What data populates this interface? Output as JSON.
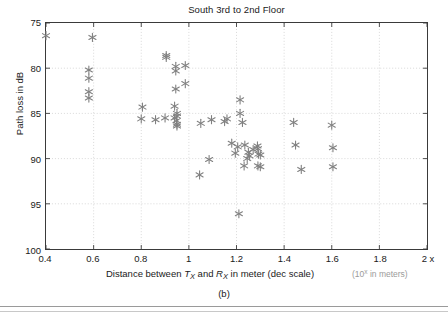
{
  "figure": {
    "panel_caption": "(b)"
  },
  "chart_data": {
    "type": "scatter",
    "title": "South 3rd to 2nd Floor",
    "xlabel": "Distance between TX and RX in meter (dec scale)",
    "xlabel_parts": {
      "a": "Distance between ",
      "t": "T",
      "tsub": "X",
      "b": " and ",
      "r": "R",
      "rsub": "X",
      "c": " in meter (dec scale)"
    },
    "xlabel_note_parts": {
      "a": "(10",
      "sup": "x",
      "b": " in meters)"
    },
    "ylabel": "Path loss in dB",
    "xlim": [
      0.4,
      2.0
    ],
    "ylim": [
      75,
      100
    ],
    "y_inverted": true,
    "grid": true,
    "legend": null,
    "marker": "asterisk-6",
    "marker_color": "#808080",
    "xticks": [
      0.4,
      0.6,
      0.8,
      1.0,
      1.2,
      1.4,
      1.6,
      1.8,
      2.0
    ],
    "xtick_labels": [
      "0.4",
      "0.6",
      "0.8",
      "1",
      "1.2",
      "1.4",
      "1.6",
      "1.8",
      "2 x"
    ],
    "yticks": [
      75,
      80,
      85,
      90,
      95,
      100
    ],
    "ytick_labels": [
      "75",
      "80",
      "85",
      "90",
      "95",
      "100"
    ],
    "points": [
      [
        0.4,
        76.4
      ],
      [
        0.595,
        76.6
      ],
      [
        0.58,
        80.2
      ],
      [
        0.58,
        81.1
      ],
      [
        0.58,
        82.6
      ],
      [
        0.58,
        83.3
      ],
      [
        0.805,
        84.3
      ],
      [
        0.8,
        85.6
      ],
      [
        0.86,
        85.7
      ],
      [
        0.905,
        78.6
      ],
      [
        0.905,
        78.8
      ],
      [
        0.945,
        79.8
      ],
      [
        0.945,
        80.3
      ],
      [
        0.985,
        79.7
      ],
      [
        0.945,
        82.3
      ],
      [
        0.985,
        81.7
      ],
      [
        0.95,
        85.0
      ],
      [
        0.95,
        85.3
      ],
      [
        0.95,
        86.2
      ],
      [
        0.95,
        86.4
      ],
      [
        0.948,
        85.8
      ],
      [
        0.94,
        84.2
      ],
      [
        0.94,
        85.5
      ],
      [
        0.9,
        85.5
      ],
      [
        1.05,
        86.1
      ],
      [
        1.095,
        85.7
      ],
      [
        1.15,
        85.9
      ],
      [
        1.16,
        85.6
      ],
      [
        1.215,
        83.5
      ],
      [
        1.215,
        85.0
      ],
      [
        1.225,
        86.0
      ],
      [
        1.18,
        88.3
      ],
      [
        1.195,
        89.4
      ],
      [
        1.205,
        88.7
      ],
      [
        1.235,
        88.5
      ],
      [
        1.25,
        89.3
      ],
      [
        1.255,
        89.7
      ],
      [
        1.245,
        90.0
      ],
      [
        1.27,
        89.0
      ],
      [
        1.288,
        88.6
      ],
      [
        1.29,
        88.9
      ],
      [
        1.292,
        89.5
      ],
      [
        1.3,
        89.6
      ],
      [
        1.3,
        90.9
      ],
      [
        1.232,
        90.8
      ],
      [
        1.29,
        90.8
      ],
      [
        1.085,
        90.1
      ],
      [
        1.045,
        91.8
      ],
      [
        1.21,
        96.1
      ],
      [
        1.44,
        86.0
      ],
      [
        1.448,
        88.5
      ],
      [
        1.472,
        91.2
      ],
      [
        1.6,
        86.3
      ],
      [
        1.605,
        88.8
      ],
      [
        1.605,
        90.9
      ]
    ]
  }
}
